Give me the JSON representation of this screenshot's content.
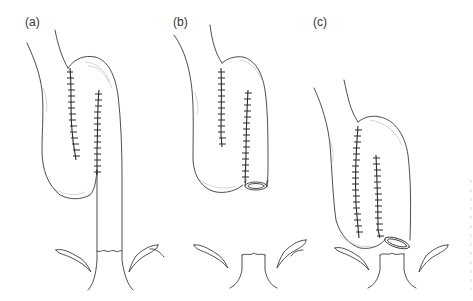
{
  "figure": {
    "panels": [
      {
        "id": "a",
        "label": "(a)"
      },
      {
        "id": "b",
        "label": "(b)"
      },
      {
        "id": "c",
        "label": "(c)"
      }
    ],
    "colors": {
      "background": "#ffffff",
      "line": "#3a3a3a",
      "shading": "#b8b8b8"
    }
  }
}
